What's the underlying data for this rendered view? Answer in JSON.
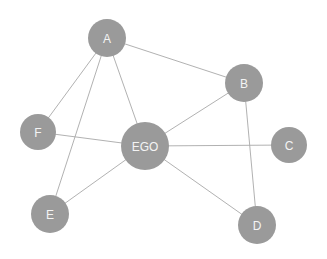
{
  "diagram": {
    "type": "ego-network",
    "colors": {
      "node_fill": "#9a9a9a",
      "node_label": "#f4f4f4",
      "edge": "#a8a8a8",
      "background": "#ffffff"
    },
    "nodes": [
      {
        "id": "A",
        "label": "A",
        "x": 107,
        "y": 38,
        "r": 19
      },
      {
        "id": "B",
        "label": "B",
        "x": 244,
        "y": 83,
        "r": 19
      },
      {
        "id": "EGO",
        "label": "EGO",
        "x": 145,
        "y": 146,
        "r": 24
      },
      {
        "id": "F",
        "label": "F",
        "x": 38,
        "y": 132,
        "r": 18
      },
      {
        "id": "C",
        "label": "C",
        "x": 289,
        "y": 145,
        "r": 18
      },
      {
        "id": "D",
        "label": "D",
        "x": 257,
        "y": 225,
        "r": 19
      },
      {
        "id": "E",
        "label": "E",
        "x": 50,
        "y": 214,
        "r": 19
      }
    ],
    "edges": [
      [
        "A",
        "B"
      ],
      [
        "A",
        "F"
      ],
      [
        "A",
        "E"
      ],
      [
        "A",
        "EGO"
      ],
      [
        "B",
        "EGO"
      ],
      [
        "B",
        "D"
      ],
      [
        "F",
        "EGO"
      ],
      [
        "EGO",
        "C"
      ],
      [
        "EGO",
        "D"
      ],
      [
        "EGO",
        "E"
      ]
    ]
  }
}
